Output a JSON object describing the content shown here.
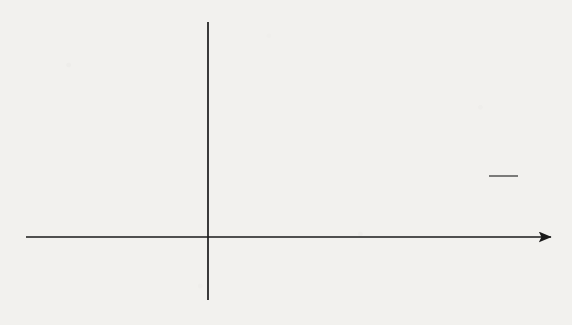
{
  "chart_data": {
    "type": "line",
    "title": "",
    "xlabel": "",
    "ylabel": "",
    "xlim": [
      -4.9,
      11.7
    ],
    "ylim": [
      -2.4,
      6.6
    ],
    "grid": false,
    "legend_position": "inline-annotations",
    "x_ticks": [
      -4,
      -3,
      -2,
      -1,
      2,
      3,
      4,
      5,
      6,
      7,
      8,
      9,
      10,
      11
    ],
    "x_tick_labels": [
      "−4",
      "−3",
      "−2",
      "−1",
      "2",
      "3",
      "4",
      "5",
      "6",
      "7",
      "8",
      "9",
      "10",
      "11"
    ],
    "y_ticks": [
      6,
      5,
      4,
      3,
      2,
      1,
      -1,
      -2
    ],
    "y_tick_labels": [
      "6",
      "5",
      "4",
      "3",
      "2",
      "1",
      "−1",
      "−2"
    ],
    "series": [
      {
        "name": "y = 4ln x",
        "expression": "4*ln(x)",
        "label_text": "y = 4ln x",
        "label_y": "y",
        "label_eq": "= 4ln",
        "label_var": "x",
        "color": "#1a1a1a",
        "arrow_start": true,
        "arrow_end": true,
        "points_x": [
          0.6,
          0.7,
          0.8,
          0.9,
          1.0,
          1.2,
          1.4,
          1.6,
          1.8,
          2.0,
          2.2,
          2.4,
          2.6,
          2.8,
          3.0,
          3.2
        ],
        "points_y": [
          -2.04,
          -1.43,
          -0.89,
          -0.42,
          0.0,
          0.73,
          1.35,
          1.88,
          2.35,
          2.77,
          3.15,
          3.5,
          3.82,
          4.12,
          4.39,
          4.65
        ]
      },
      {
        "name": "y = 12/(x+1)",
        "expression": "12/(x+1)",
        "label_y": "y",
        "label_eq": "=",
        "label_num": "12",
        "label_den_var": "x",
        "label_den_rest": "+ 1",
        "color": "#1a1a1a",
        "arrow_start": false,
        "arrow_end": true,
        "points_x": [
          0.85,
          1.0,
          1.25,
          1.5,
          2.0,
          2.5,
          3.0,
          4.0,
          5.0,
          6.0,
          7.0,
          8.0,
          9.0,
          10.0,
          11.0
        ],
        "points_y": [
          6.49,
          6.0,
          5.33,
          4.8,
          4.0,
          3.43,
          3.0,
          2.4,
          2.0,
          1.71,
          1.5,
          1.33,
          1.2,
          1.09,
          1.0
        ]
      }
    ],
    "vertical_line": {
      "name": "x = 1",
      "x": 1.0,
      "y_from": -2.15,
      "y_to": 6.55,
      "color": "#1a1a1a"
    },
    "shaded_region": {
      "name": "area-between-curves",
      "fill_color": "#808080",
      "x_from": 1.0,
      "x_to": 2.0,
      "upper_curve": "y = 12/(x+1)",
      "lower_curve": "y = 4ln x",
      "left_boundary": "x = 1"
    },
    "intersection": {
      "x": 2.0,
      "y": 3.84
    },
    "annotations": [
      {
        "name": "label-4lnx",
        "text": "y = 4ln x",
        "x": 3.6,
        "y": 5.0
      },
      {
        "name": "label-12-over-x-plus-1",
        "text": "y = 12/(x + 1)",
        "x": 9.4,
        "y": 2.5
      }
    ]
  },
  "figure": {
    "background_color": "#f2f1ee",
    "axis_color": "#1a1a1a",
    "tick_label_color": "#1a1a1a"
  }
}
